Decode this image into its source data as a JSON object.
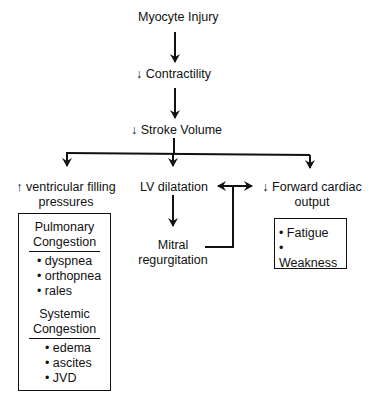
{
  "nodes": {
    "myocyte_injury": "Myocyte Injury",
    "contractility": "↓ Contractility",
    "stroke_volume": "↓ Stroke Volume",
    "filling_pressures_line1": "↑ ventricular filling",
    "filling_pressures_line2": "pressures",
    "lv_dilatation": "LV dilatation",
    "forward_output_line1": "↓ Forward cardiac",
    "forward_output_line2": "output",
    "mitral_line1": "Mitral",
    "mitral_line2": "regurgitation"
  },
  "congestion_box": {
    "pulmonary": {
      "title_line1": "Pulmonary",
      "title_line2": "Congestion",
      "items": [
        "• dyspnea",
        "• orthopnea",
        "• rales"
      ]
    },
    "systemic": {
      "title_line1": "Systemic",
      "title_line2": "Congestion",
      "items": [
        "• edema",
        "• ascites",
        "• JVD"
      ]
    }
  },
  "output_box": {
    "items": [
      "• Fatigue",
      "• Weakness"
    ]
  }
}
